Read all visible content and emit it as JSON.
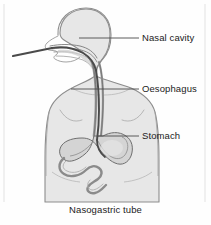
{
  "figure": {
    "caption": "Nasogastric tube",
    "title": "Nasogastric tube",
    "labels": [
      {
        "id": "nasal-cavity",
        "text": "Nasal cavity"
      },
      {
        "id": "oesophagus",
        "text": "Oesophagus"
      },
      {
        "id": "stomach",
        "text": "Stomach"
      }
    ],
    "colors": {
      "background": "#fefefe",
      "body_fill": "#e7e7e7",
      "body_outline": "#8d8d8d",
      "organ_fill": "#d2d2d2",
      "organ_outline": "#6e6e6e",
      "tube_stroke": "#4a4a4a",
      "leader_line": "#4a4a4a",
      "text": "#1b1b1b",
      "frame": "#d9d9d9"
    },
    "anatomy": [
      {
        "id": "head",
        "name": "head-silhouette"
      },
      {
        "id": "torso",
        "name": "torso-silhouette"
      },
      {
        "id": "nasal-passage",
        "name": "nasal-cavity-structure"
      },
      {
        "id": "oesophagus-tract",
        "name": "oesophagus-structure"
      },
      {
        "id": "stomach-organ",
        "name": "stomach-structure"
      },
      {
        "id": "intestines",
        "name": "intestine-structure"
      },
      {
        "id": "tube",
        "name": "nasogastric-tube-path"
      }
    ]
  }
}
